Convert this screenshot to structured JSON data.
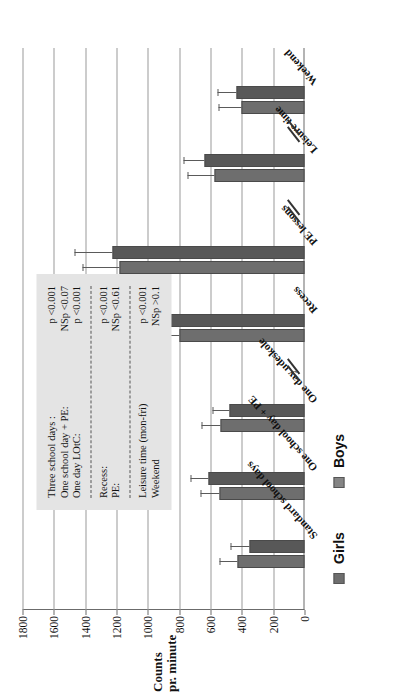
{
  "figure": {
    "axis_title_line1": "Counts",
    "axis_title_line2": "pr. minute"
  },
  "legend": {
    "items": [
      {
        "label": "Girls",
        "color": "#6e6e6e"
      },
      {
        "label": "Boys",
        "color": "#858585"
      }
    ]
  },
  "stats_box": {
    "sections": [
      {
        "rows": [
          {
            "label": "Three school days :",
            "ns": "",
            "p": "p <0.001"
          },
          {
            "label": "One school day + PE:",
            "ns": "NS",
            "p": "p <0.07"
          },
          {
            "label": "One day LOtC:",
            "ns": "",
            "p": "p <0.001"
          }
        ]
      },
      {
        "rows": [
          {
            "label": "Recess:",
            "ns": "",
            "p": "p <0.001"
          },
          {
            "label": "PE:",
            "ns": "NS",
            "p": "p <0.61"
          }
        ]
      },
      {
        "rows": [
          {
            "label": "Leisure time (mon-fri)",
            "ns": "",
            "p": "p <0.001"
          },
          {
            "label": "Weekend",
            "ns": "NS",
            "p": "p >0.1"
          }
        ]
      }
    ]
  },
  "chart_data": {
    "type": "bar",
    "orientation": "vertical-rotated",
    "title": "",
    "xlabel": "",
    "ylabel": "Counts pr. minute",
    "ylim": [
      0,
      1800
    ],
    "yticks": [
      0,
      200,
      400,
      600,
      800,
      1000,
      1200,
      1400,
      1600,
      1800
    ],
    "ytick_labels": [
      "0",
      "200",
      "400",
      "600",
      "800",
      "1000",
      "1200",
      "1400",
      "1600",
      "1800"
    ],
    "grid": true,
    "legend_position": "bottom-left",
    "axis_breaks_after": [
      "One day udeskole",
      "PE lessons",
      "Leisure time"
    ],
    "categories": [
      "Standard school days",
      "One school day + PE",
      "One day udeskole",
      "Recess",
      "PE lessons",
      "Leisure time",
      "Weekend"
    ],
    "series": [
      {
        "name": "Girls",
        "color": "#6e6e6e",
        "values": [
          430,
          545,
          535,
          800,
          1180,
          575,
          400
        ],
        "errors": [
          115,
          120,
          125,
          420,
          240,
          175,
          150
        ]
      },
      {
        "name": "Boys",
        "color": "#585858",
        "values": [
          350,
          610,
          480,
          1000,
          1225,
          640,
          435
        ],
        "errors": [
          120,
          115,
          110,
          225,
          245,
          130,
          120
        ]
      }
    ]
  }
}
